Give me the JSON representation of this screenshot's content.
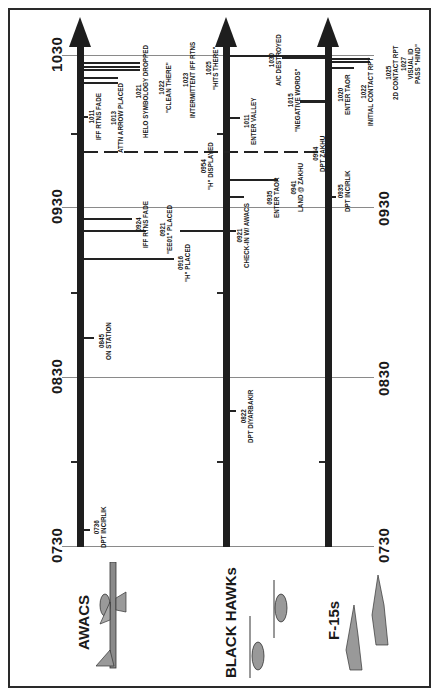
{
  "time_axis": {
    "labels": [
      "0730",
      "0830",
      "0930",
      "1030"
    ],
    "y_positions": [
      546,
      377,
      207,
      55
    ]
  },
  "tracks": [
    {
      "name": "AWACS",
      "icon": "awacs-aircraft-icon"
    },
    {
      "name": "BLACK HAWKs",
      "icon": "blackhawk-helicopter-icon"
    },
    {
      "name": "F-15s",
      "icon": "f15-fighter-icon"
    }
  ],
  "awacs_events": [
    {
      "time": "0736",
      "label": "DPT INCIRLIK"
    },
    {
      "time": "0845",
      "label": "ON STATION"
    },
    {
      "time": "0916",
      "label": "\"H\" PLACED"
    },
    {
      "time": "0921",
      "label": "\"EE01\" PLACED"
    },
    {
      "time": "0924",
      "label": "IFF RTNS FADE"
    },
    {
      "time": "1011",
      "label": "IFF RTNS FADE"
    },
    {
      "time": "1013",
      "label": "ATTN ARROW PLACED"
    },
    {
      "time": "1021",
      "label": "HELO SYMBOLOGY DROPPED"
    },
    {
      "time": "1022",
      "label": "\"CLEAN THERE\""
    },
    {
      "time": "1023",
      "label": "INTERMITTENT IFF RTNS"
    },
    {
      "time": "1025",
      "label": "\"HITS THERE\""
    }
  ],
  "blackhawk_events": [
    {
      "time": "0822",
      "label": "DPT DIYARBAKIR"
    },
    {
      "time": "0921",
      "label": "CHECK-IN W/ AWACS"
    },
    {
      "time": "0935",
      "label": "ENTER TAOR"
    },
    {
      "time": "0941",
      "label": "LAND @ ZAKHU"
    },
    {
      "time": "0954",
      "label": "\"H\" DISPLAYED"
    },
    {
      "time": "0954",
      "label": "DPT ZAKHU"
    },
    {
      "time": "1011",
      "label": "ENTER VALLEY"
    },
    {
      "time": "1015",
      "label": "\"NEGATIVE WORDS\""
    },
    {
      "time": "1030",
      "label": "A/C DESTROYED"
    }
  ],
  "f15_events": [
    {
      "time": "0935",
      "label": "DPT INCIRLIK"
    },
    {
      "time": "1020",
      "label": "ENTER TAOR"
    },
    {
      "time": "1022",
      "label": "INITIAL CONTACT RPT"
    },
    {
      "time": "1025",
      "label": "2D CONTACT RPT"
    },
    {
      "time": "1027",
      "label": "VISUAL ID PASS \"HIND\""
    }
  ]
}
